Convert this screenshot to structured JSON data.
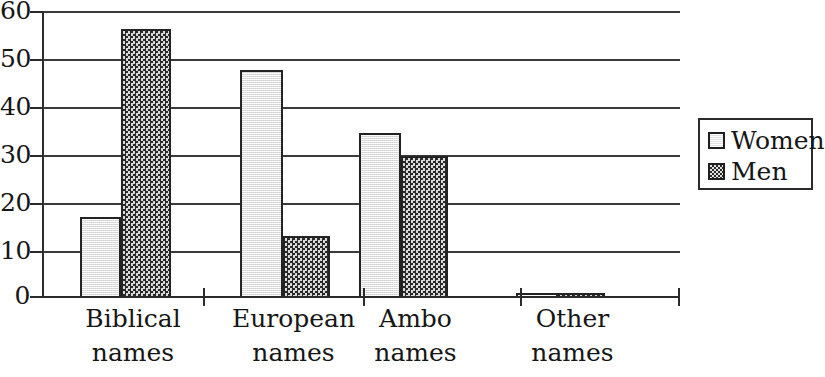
{
  "chart_data": {
    "type": "bar",
    "title": "",
    "xlabel": "",
    "ylabel": "",
    "categories": [
      "Biblical names",
      "European names",
      "Ambo names",
      "Other names"
    ],
    "category_lines": [
      [
        "Biblical",
        "names"
      ],
      [
        "European",
        "names"
      ],
      [
        "Ambo",
        "names"
      ],
      [
        "Other",
        "names"
      ]
    ],
    "series": [
      {
        "name": "Women",
        "values": [
          17,
          47.7,
          34.6,
          1
        ],
        "color": "#e9e9e9",
        "pattern": "light-speckle"
      },
      {
        "name": "Men",
        "values": [
          56.2,
          13,
          29.7,
          1
        ],
        "color": "#6e6e6e",
        "pattern": "checkerboard"
      }
    ],
    "ylim": [
      0,
      60
    ],
    "yticks": [
      0,
      10,
      20,
      30,
      40,
      50,
      60
    ],
    "ytick_labels": [
      "0",
      "10",
      "20",
      "30",
      "40",
      "50",
      "60"
    ],
    "grid": true,
    "legend_position": "right",
    "legend_entries": [
      "Women",
      "Men"
    ]
  },
  "axis": {
    "y_ticks": [
      {
        "label": "60",
        "value": 60
      },
      {
        "label": "50",
        "value": 50
      },
      {
        "label": "40",
        "value": 40
      },
      {
        "label": "30",
        "value": 30
      },
      {
        "label": "20",
        "value": 20
      },
      {
        "label": "10",
        "value": 10
      },
      {
        "label": "0",
        "value": 0
      }
    ]
  },
  "legend": {
    "items": [
      {
        "label": "Women",
        "swatch": "light-square-icon"
      },
      {
        "label": "Men",
        "swatch": "checkered-square-icon"
      }
    ]
  }
}
